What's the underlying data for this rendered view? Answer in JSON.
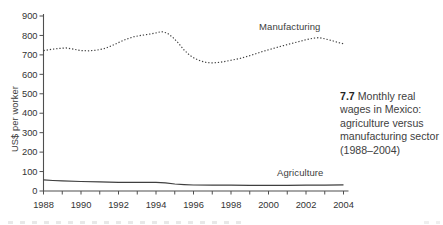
{
  "caption": {
    "number": "7.7",
    "text": "Monthly real wages in Mexico: agriculture versus manufacturing sector (1988–2004)"
  },
  "y_axis_label": "US$ per worker",
  "series_labels": {
    "manufacturing": "Manufacturing",
    "agriculture": "Agriculture"
  },
  "colors": {
    "line": "#3f3f3f",
    "axis": "#4f4f4f",
    "tick_label": "#333333",
    "caption_text": "#3e3e3e"
  },
  "chart_data": {
    "type": "line",
    "title": "",
    "xlabel": "",
    "ylabel": "US$ per worker",
    "ylim": [
      0,
      900
    ],
    "xlim": [
      1988,
      2004
    ],
    "grid": false,
    "legend": "inline-labels",
    "y_ticks": [
      0,
      100,
      200,
      300,
      400,
      500,
      600,
      700,
      800,
      900
    ],
    "x_ticks": [
      1988,
      1990,
      1992,
      1994,
      1996,
      1998,
      2000,
      2002,
      2004
    ],
    "x_minor_tick_step": 1,
    "series": [
      {
        "name": "Manufacturing",
        "line_style": "dotted",
        "x": [
          1988,
          1988.4,
          1988.8,
          1989.2,
          1989.6,
          1990,
          1990.4,
          1990.8,
          1991.2,
          1991.6,
          1992,
          1992.4,
          1992.8,
          1993.2,
          1993.6,
          1994,
          1994.3,
          1994.6,
          1994.9,
          1995.2,
          1995.5,
          1995.8,
          1996.1,
          1996.4,
          1996.7,
          1997,
          1997.3,
          1997.6,
          1998,
          1998.4,
          1998.8,
          1999.2,
          1999.6,
          2000,
          2000.4,
          2000.8,
          2001.2,
          2001.6,
          2002,
          2002.4,
          2002.7,
          2003,
          2003.4,
          2003.7,
          2004
        ],
        "values": [
          722,
          728,
          733,
          736,
          730,
          722,
          721,
          724,
          731,
          745,
          763,
          780,
          793,
          800,
          806,
          813,
          820,
          812,
          790,
          760,
          725,
          698,
          680,
          668,
          661,
          659,
          661,
          665,
          672,
          680,
          690,
          702,
          715,
          726,
          737,
          748,
          758,
          768,
          778,
          786,
          789,
          783,
          773,
          764,
          757
        ]
      },
      {
        "name": "Agriculture",
        "line_style": "solid",
        "x": [
          1988,
          1988.5,
          1989,
          1990,
          1991,
          1992,
          1993,
          1994,
          1994.5,
          1995,
          1995.5,
          1996,
          1997,
          1998,
          1999,
          2000,
          2001,
          2002,
          2003,
          2004
        ],
        "values": [
          57,
          54,
          52,
          49,
          47,
          45,
          45,
          44,
          42,
          36,
          33,
          31,
          30,
          30,
          29,
          29,
          29,
          30,
          30,
          32
        ]
      }
    ]
  }
}
